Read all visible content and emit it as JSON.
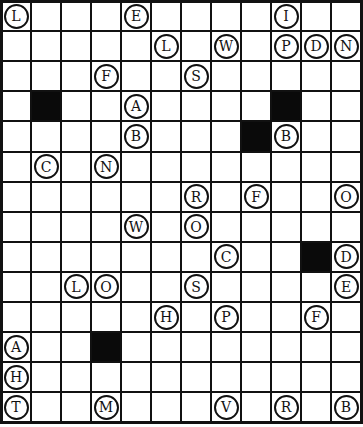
{
  "puzzle": {
    "cols": 12,
    "rows": 14,
    "colors": {
      "line": "#111111",
      "black": "#0a0a0a",
      "background": "#ffffff"
    },
    "black_cells": [
      {
        "r": 3,
        "c": 1
      },
      {
        "r": 3,
        "c": 9
      },
      {
        "r": 4,
        "c": 8
      },
      {
        "r": 8,
        "c": 10
      },
      {
        "r": 11,
        "c": 3
      }
    ],
    "letters": [
      {
        "r": 0,
        "c": 0,
        "ch": "L"
      },
      {
        "r": 0,
        "c": 4,
        "ch": "E"
      },
      {
        "r": 0,
        "c": 9,
        "ch": "I"
      },
      {
        "r": 1,
        "c": 5,
        "ch": "L"
      },
      {
        "r": 1,
        "c": 7,
        "ch": "W"
      },
      {
        "r": 1,
        "c": 9,
        "ch": "P"
      },
      {
        "r": 1,
        "c": 10,
        "ch": "D"
      },
      {
        "r": 1,
        "c": 11,
        "ch": "N"
      },
      {
        "r": 2,
        "c": 3,
        "ch": "F"
      },
      {
        "r": 2,
        "c": 6,
        "ch": "S"
      },
      {
        "r": 3,
        "c": 4,
        "ch": "A"
      },
      {
        "r": 4,
        "c": 4,
        "ch": "B"
      },
      {
        "r": 4,
        "c": 9,
        "ch": "B"
      },
      {
        "r": 5,
        "c": 1,
        "ch": "C"
      },
      {
        "r": 5,
        "c": 3,
        "ch": "N"
      },
      {
        "r": 6,
        "c": 6,
        "ch": "R"
      },
      {
        "r": 6,
        "c": 8,
        "ch": "F"
      },
      {
        "r": 6,
        "c": 11,
        "ch": "O"
      },
      {
        "r": 7,
        "c": 4,
        "ch": "W"
      },
      {
        "r": 7,
        "c": 6,
        "ch": "O"
      },
      {
        "r": 8,
        "c": 7,
        "ch": "C"
      },
      {
        "r": 8,
        "c": 11,
        "ch": "D"
      },
      {
        "r": 9,
        "c": 2,
        "ch": "L"
      },
      {
        "r": 9,
        "c": 3,
        "ch": "O"
      },
      {
        "r": 9,
        "c": 6,
        "ch": "S"
      },
      {
        "r": 9,
        "c": 11,
        "ch": "E"
      },
      {
        "r": 10,
        "c": 5,
        "ch": "H"
      },
      {
        "r": 10,
        "c": 7,
        "ch": "P"
      },
      {
        "r": 10,
        "c": 10,
        "ch": "F"
      },
      {
        "r": 11,
        "c": 0,
        "ch": "A"
      },
      {
        "r": 12,
        "c": 0,
        "ch": "H"
      },
      {
        "r": 13,
        "c": 0,
        "ch": "T"
      },
      {
        "r": 13,
        "c": 3,
        "ch": "M"
      },
      {
        "r": 13,
        "c": 7,
        "ch": "V"
      },
      {
        "r": 13,
        "c": 9,
        "ch": "R"
      },
      {
        "r": 13,
        "c": 11,
        "ch": "B"
      }
    ]
  }
}
